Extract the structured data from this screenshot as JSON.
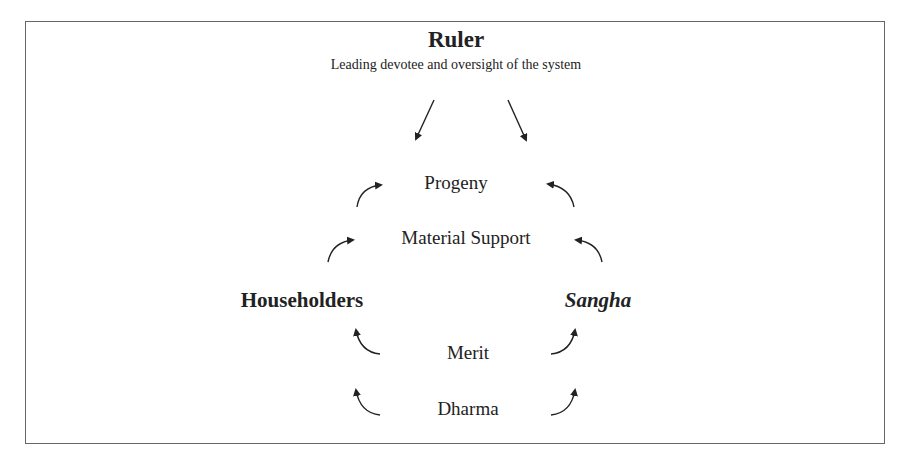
{
  "diagram": {
    "ruler": {
      "title": "Ruler",
      "subtitle": "Leading devotee and oversight of the system"
    },
    "flows_up": [
      {
        "label": "Progeny"
      },
      {
        "label": "Material Support"
      }
    ],
    "parties": {
      "left": "Householders",
      "right": "Sangha"
    },
    "flows_down": [
      {
        "label": "Merit"
      },
      {
        "label": "Dharma"
      }
    ],
    "colors": {
      "text": "#222222",
      "border": "#666666",
      "background": "#ffffff"
    }
  }
}
